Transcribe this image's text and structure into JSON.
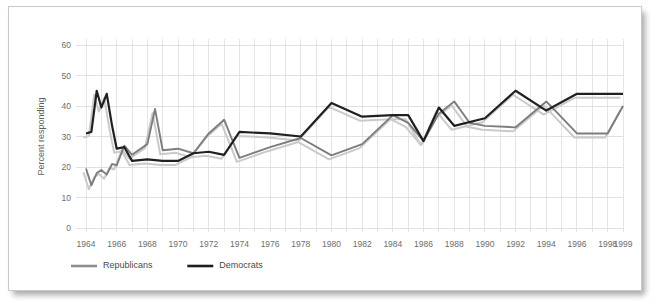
{
  "chart_data": {
    "type": "line",
    "title": "",
    "xlabel": "",
    "ylabel": "Percent responding",
    "xlim": [
      1964,
      1999
    ],
    "ylim": [
      0,
      60
    ],
    "yticks": [
      0,
      10,
      20,
      30,
      40,
      50,
      60
    ],
    "xticks": [
      1964,
      1966,
      1968,
      1970,
      1972,
      1974,
      1976,
      1978,
      1980,
      1982,
      1984,
      1986,
      1988,
      1990,
      1992,
      1994,
      1996,
      1998,
      1999
    ],
    "grid": true,
    "legend_position": "bottom-left",
    "series": [
      {
        "name": "Republicans",
        "color": "#7d7d7d",
        "x": [
          1964,
          1964.35,
          1964.7,
          1965,
          1965.35,
          1965.7,
          1966,
          1966.5,
          1967,
          1968,
          1968.5,
          1969,
          1970,
          1971,
          1972,
          1973,
          1974,
          1976,
          1978,
          1980,
          1982,
          1984,
          1985,
          1986,
          1987,
          1988,
          1989,
          1990,
          1992,
          1994,
          1996,
          1998,
          1999
        ],
        "values": [
          19.5,
          14.0,
          18.0,
          19.0,
          17.5,
          21.0,
          20.5,
          27.0,
          24.0,
          27.5,
          39.0,
          25.5,
          26.0,
          24.5,
          31.0,
          35.5,
          23.0,
          26.5,
          29.5,
          23.8,
          27.5,
          37.0,
          34.5,
          28.5,
          37.5,
          41.5,
          34.5,
          33.5,
          33.0,
          41.5,
          31.0,
          31.0,
          40.0
        ]
      },
      {
        "name": "Democrats",
        "color": "#202020",
        "x": [
          1964,
          1964.35,
          1964.7,
          1965,
          1965.35,
          1965.7,
          1966,
          1966.5,
          1967,
          1968,
          1969,
          1970,
          1971,
          1972,
          1973,
          1974,
          1976,
          1978,
          1980,
          1982,
          1984,
          1985,
          1986,
          1987,
          1988,
          1990,
          1992,
          1994,
          1996,
          1998,
          1999
        ],
        "values": [
          31.0,
          31.5,
          45.0,
          39.5,
          44.0,
          33.5,
          26.0,
          26.5,
          22.0,
          22.5,
          22.0,
          22.0,
          24.5,
          25.0,
          24.0,
          31.5,
          31.0,
          30.0,
          41.0,
          36.5,
          37.0,
          37.0,
          28.5,
          39.5,
          33.5,
          36.0,
          45.0,
          38.5,
          44.0,
          44.0,
          44.0
        ]
      }
    ]
  },
  "legend": {
    "items": [
      {
        "label": "Republicans",
        "color": "#8f8f8f"
      },
      {
        "label": "Democrats",
        "color": "#1e1e1e"
      }
    ]
  },
  "axis": {
    "y_title": "Percent responding"
  }
}
